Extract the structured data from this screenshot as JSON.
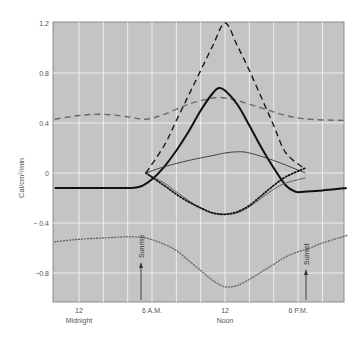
{
  "chart_data": {
    "type": "line",
    "title": "",
    "xlabel": "",
    "ylabel": "Cal/cm²/min",
    "xlim": [
      -2,
      22
    ],
    "ylim": [
      -1.03,
      1.2
    ],
    "grid": true,
    "x_unit": "hours after midnight",
    "x_ticks": [
      {
        "x": 0,
        "label": "12",
        "sublabel": "Midnight"
      },
      {
        "x": 6,
        "label": "6 A.M.",
        "sublabel": ""
      },
      {
        "x": 12,
        "label": "12",
        "sublabel": "Noon"
      },
      {
        "x": 18,
        "label": "6 P.M.",
        "sublabel": ""
      }
    ],
    "y_ticks": [
      1.2,
      0.8,
      0.4,
      0,
      -0.4,
      -0.8
    ],
    "y_tick_labels": [
      "1.2",
      "0.8",
      "0.4",
      "0",
      "− 0.4",
      "−0.8"
    ],
    "annotations": [
      {
        "label": "Sunrise",
        "x": 5.5,
        "type": "arrow"
      },
      {
        "label": "Sunset",
        "x": 18.6,
        "type": "arrow"
      }
    ],
    "series": [
      {
        "name": "heavy-dashed",
        "style": "dashed-black",
        "x": [
          5.5,
          7,
          8,
          9,
          10,
          11,
          12,
          13,
          14,
          15,
          16,
          17,
          18.6
        ],
        "values": [
          0.0,
          0.22,
          0.42,
          0.62,
          0.82,
          1.02,
          1.2,
          1.02,
          0.82,
          0.6,
          0.38,
          0.16,
          0.03
        ]
      },
      {
        "name": "grey-dashed",
        "style": "dashed-grey",
        "x": [
          -2,
          0,
          2,
          4,
          5.5,
          7,
          9,
          11,
          12,
          13,
          15,
          17,
          19,
          22
        ],
        "values": [
          0.43,
          0.46,
          0.47,
          0.45,
          0.43,
          0.47,
          0.55,
          0.6,
          0.6,
          0.58,
          0.52,
          0.46,
          0.43,
          0.42
        ]
      },
      {
        "name": "heavy-solid",
        "style": "solid-thick-black",
        "x": [
          -2,
          0,
          2,
          4,
          5,
          6,
          7,
          8,
          9,
          10,
          11,
          11.5,
          12,
          13,
          14,
          15,
          16,
          17,
          17.8,
          18.5,
          20,
          22
        ],
        "values": [
          -0.12,
          -0.12,
          -0.12,
          -0.12,
          -0.11,
          -0.05,
          0.05,
          0.18,
          0.33,
          0.5,
          0.64,
          0.68,
          0.66,
          0.55,
          0.38,
          0.2,
          0.04,
          -0.1,
          -0.15,
          -0.15,
          -0.14,
          -0.12
        ]
      },
      {
        "name": "thin-solid-upper",
        "style": "solid-thin-dark",
        "x": [
          5.5,
          7,
          9,
          11,
          12,
          13,
          14,
          16,
          18.6
        ],
        "values": [
          0.0,
          0.05,
          0.1,
          0.14,
          0.16,
          0.17,
          0.16,
          0.1,
          0.0
        ]
      },
      {
        "name": "thin-solid-lower",
        "style": "solid-thin-grey",
        "x": [
          5.5,
          7,
          8,
          9,
          10,
          11,
          12,
          13,
          14,
          15,
          16,
          17,
          18.6
        ],
        "values": [
          0.0,
          -0.08,
          -0.15,
          -0.22,
          -0.28,
          -0.32,
          -0.33,
          -0.32,
          -0.27,
          -0.2,
          -0.13,
          -0.08,
          -0.04
        ]
      },
      {
        "name": "heavy-dotted",
        "style": "dotted-black",
        "x": [
          5.5,
          7,
          8,
          9,
          10,
          11,
          12,
          13,
          14,
          15,
          16,
          17,
          18.6
        ],
        "values": [
          0.0,
          -0.1,
          -0.17,
          -0.23,
          -0.28,
          -0.32,
          -0.33,
          -0.31,
          -0.26,
          -0.18,
          -0.1,
          -0.03,
          0.04
        ]
      },
      {
        "name": "grey-dotted",
        "style": "dotted-grey",
        "x": [
          -2,
          0,
          2,
          4,
          5.5,
          7,
          8,
          9,
          10,
          11,
          12,
          13,
          14,
          15,
          16,
          17,
          18,
          19,
          20,
          22
        ],
        "values": [
          -0.55,
          -0.53,
          -0.52,
          -0.51,
          -0.52,
          -0.57,
          -0.62,
          -0.7,
          -0.78,
          -0.86,
          -0.91,
          -0.9,
          -0.85,
          -0.79,
          -0.73,
          -0.67,
          -0.63,
          -0.6,
          -0.56,
          -0.5
        ]
      }
    ]
  },
  "labels": {
    "yaxis": "Cal/cm²/min",
    "sunrise": "Sunrise",
    "sunset": "Sunset"
  },
  "colors": {
    "plot_bg": "#c4c4c4",
    "grid": "#f2f2f2",
    "black": "#111111",
    "grey": "#6a6a6a"
  }
}
